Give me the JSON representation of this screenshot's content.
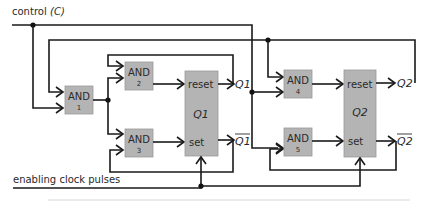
{
  "diagram": {
    "labels": {
      "control": "control",
      "control_symbol": "(C)",
      "clock": "enabling clock pulses"
    },
    "gates": [
      {
        "id": "and1",
        "label": "AND",
        "number": "1"
      },
      {
        "id": "and2",
        "label": "AND",
        "number": "2"
      },
      {
        "id": "and3",
        "label": "AND",
        "number": "3"
      },
      {
        "id": "and4",
        "label": "AND",
        "number": "4"
      },
      {
        "id": "and5",
        "label": "AND",
        "number": "5"
      }
    ],
    "flipflops": [
      {
        "id": "ff1",
        "name": "Q1",
        "reset": "reset",
        "set": "set",
        "out": "Q1",
        "out_bar": "Q1"
      },
      {
        "id": "ff2",
        "name": "Q2",
        "reset": "reset",
        "set": "set",
        "out": "Q2",
        "out_bar": "Q2"
      }
    ],
    "colors": {
      "block_fill": "#b4b4b4",
      "wire": "#1a1a1a"
    }
  }
}
